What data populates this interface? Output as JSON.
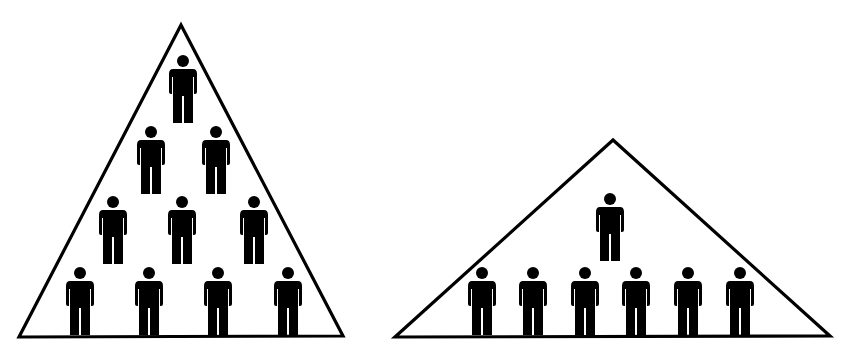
{
  "diagram": {
    "title": "",
    "colors": {
      "stroke": "#000000",
      "fill": "#ffffff",
      "figure": "#000000"
    },
    "pyramids": [
      {
        "name": "tall-pyramid",
        "apex": [
          181,
          25
        ],
        "base_left": [
          19,
          337
        ],
        "base_right": [
          343,
          336
        ],
        "total_people": 10,
        "rows": [
          {
            "count": 1,
            "top_y": 55,
            "xs": [
              183
            ]
          },
          {
            "count": 2,
            "top_y": 126,
            "xs": [
              151,
              216
            ]
          },
          {
            "count": 3,
            "top_y": 196,
            "xs": [
              113,
              182,
              254
            ]
          },
          {
            "count": 4,
            "top_y": 267,
            "xs": [
              80,
              149,
              218,
              288
            ]
          }
        ]
      },
      {
        "name": "flat-pyramid",
        "apex": [
          613,
          140
        ],
        "base_left": [
          395,
          337
        ],
        "base_right": [
          830,
          336
        ],
        "total_people": 7,
        "rows": [
          {
            "count": 1,
            "top_y": 193,
            "xs": [
              610
            ]
          },
          {
            "count": 6,
            "top_y": 267,
            "xs": [
              482,
              533,
              585,
              636,
              688,
              740
            ]
          }
        ]
      }
    ],
    "icon": "person-icon"
  }
}
